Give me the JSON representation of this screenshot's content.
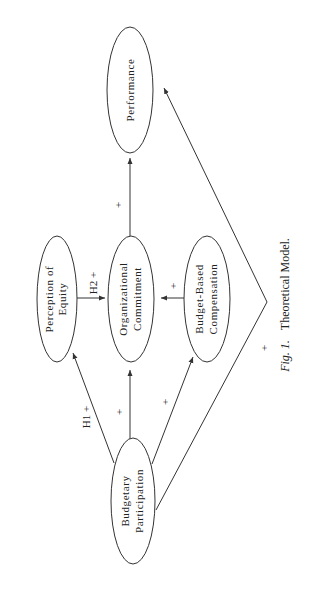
{
  "diagram": {
    "type": "path-model",
    "orientation": "rotated-90-ccw",
    "nodes": [
      {
        "id": "performance",
        "lines": [
          "Performance"
        ]
      },
      {
        "id": "perception_of_equity",
        "lines": [
          "Perception of",
          "Equity"
        ]
      },
      {
        "id": "organizational_commitment",
        "lines": [
          "Organizational",
          "Commitment"
        ]
      },
      {
        "id": "budget_based_compensation",
        "lines": [
          "Budget-Based",
          "Compensation"
        ]
      },
      {
        "id": "budgetary_participation",
        "lines": [
          "Budgetary",
          "Participation"
        ]
      }
    ],
    "edges": [
      {
        "from": "budgetary_participation",
        "to": "perception_of_equity",
        "label": "H1 +"
      },
      {
        "from": "budgetary_participation",
        "to": "organizational_commitment",
        "label": "+"
      },
      {
        "from": "budgetary_participation",
        "to": "budget_based_compensation",
        "label": "+"
      },
      {
        "from": "budgetary_participation",
        "to": "performance",
        "label": "+"
      },
      {
        "from": "perception_of_equity",
        "to": "organizational_commitment",
        "label": "H2 +"
      },
      {
        "from": "budget_based_compensation",
        "to": "organizational_commitment",
        "label": "+"
      },
      {
        "from": "organizational_commitment",
        "to": "performance",
        "label": "+"
      }
    ]
  },
  "caption": {
    "fig": "Fig. 1.",
    "title": "Theoretical Model."
  }
}
